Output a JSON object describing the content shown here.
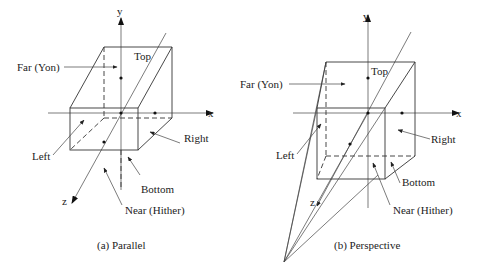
{
  "figure": {
    "panels": [
      {
        "id": "parallel",
        "caption": "(a) Parallel",
        "axes": {
          "x": "x",
          "y": "y",
          "z": "z"
        },
        "labels": {
          "far": "Far (Yon)",
          "top": "Top",
          "right": "Right",
          "left": "Left",
          "bottom": "Bottom",
          "near": "Near (Hither)"
        }
      },
      {
        "id": "perspective",
        "caption": "(b) Perspective",
        "axes": {
          "x": "x",
          "y": "y",
          "z": "z"
        },
        "labels": {
          "far": "Far (Yon)",
          "top": "Top",
          "right": "Right",
          "left": "Left",
          "bottom": "Bottom",
          "near": "Near (Hither)"
        }
      }
    ]
  }
}
